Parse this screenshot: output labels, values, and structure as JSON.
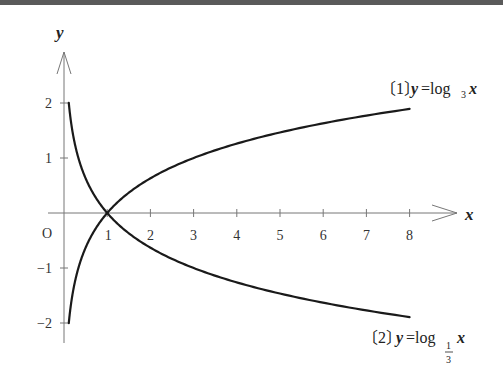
{
  "chart_data": {
    "type": "line",
    "title": "",
    "xlabel": "x",
    "ylabel": "y",
    "origin_label": "O",
    "xlim": [
      0,
      9.1
    ],
    "ylim": [
      -2.3,
      3
    ],
    "x_ticks": [
      1,
      2,
      3,
      4,
      5,
      6,
      7,
      8
    ],
    "x_tick_labels": [
      "1",
      "2",
      "3",
      "4",
      "5",
      "6",
      "7",
      "8"
    ],
    "y_ticks": [
      2,
      1,
      -1,
      -2
    ],
    "y_tick_labels": [
      "2",
      "1",
      "−1",
      "−2"
    ],
    "grid": false,
    "x_domain": [
      0.111,
      8
    ],
    "series": [
      {
        "name": "y = log_3 x",
        "function": "log3",
        "base": 3,
        "label_index": "〔1〕",
        "label_prefix": "y",
        "label_eq": "=log",
        "label_base": "3",
        "label_suffix": "x",
        "label_position": "top-right",
        "sample_points": [
          [
            0.111,
            -2
          ],
          [
            0.333,
            -1
          ],
          [
            1,
            0
          ],
          [
            3,
            1
          ],
          [
            8,
            1.89
          ]
        ]
      },
      {
        "name": "y = log_{1/3} x",
        "function": "log1/3",
        "base": 0.3333,
        "label_index": "〔2〕",
        "label_prefix": "y",
        "label_eq": "=log",
        "label_base_num": "1",
        "label_base_den": "3",
        "label_suffix": "x",
        "label_position": "bottom-right",
        "sample_points": [
          [
            0.111,
            2
          ],
          [
            0.333,
            1
          ],
          [
            1,
            0
          ],
          [
            3,
            -1
          ],
          [
            8,
            -1.89
          ]
        ]
      }
    ],
    "colors": {
      "curve": "#1a1a1a",
      "axis": "#777777",
      "text": "#222222"
    }
  }
}
